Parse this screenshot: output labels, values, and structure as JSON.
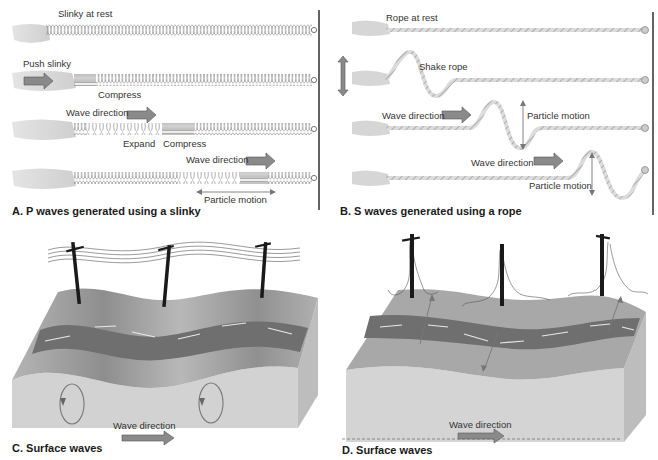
{
  "panels": {
    "a": {
      "caption": "A. P waves generated using a slinky",
      "rows": [
        {
          "label": "Slinky at rest"
        },
        {
          "label": "Push slinky",
          "sublabel": "Compress"
        },
        {
          "label": "Wave direction",
          "sublabels": [
            "Expand",
            "Compress"
          ]
        },
        {
          "label": "Wave direction",
          "sublabel": "Particle motion"
        }
      ]
    },
    "b": {
      "caption": "B. S waves generated using a rope",
      "rows": [
        {
          "label": "Rope at rest"
        },
        {
          "label": "Shake rope"
        },
        {
          "label": "Wave direction",
          "sublabel": "Particle motion"
        },
        {
          "label": "Wave direction",
          "sublabel": "Particle motion"
        }
      ]
    },
    "c": {
      "caption": "C. Surface waves",
      "wave_label": "Wave direction"
    },
    "d": {
      "caption": "D. Surface waves",
      "wave_label": "Wave direction"
    }
  },
  "colors": {
    "arrow_fill": "#8a8a8a",
    "arrow_stroke": "#555555",
    "road": "#6f6f6f",
    "ground_top": "#a9a9a9",
    "ground_side": "#cfcfcf",
    "pole": "#1a1a1a"
  }
}
